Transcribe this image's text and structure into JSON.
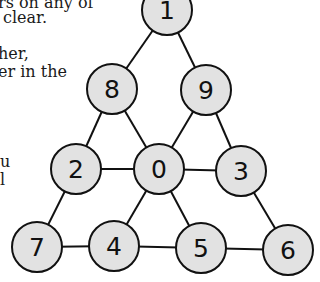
{
  "text_fragments": [
    {
      "text": "rs on any of",
      "x": -2,
      "y": -6
    },
    {
      "text": "clear.",
      "x": 3,
      "y": 9
    },
    {
      "text": "her,",
      "x": -2,
      "y": 45
    },
    {
      "text": "er in the",
      "x": -2,
      "y": 63
    },
    {
      "text": "u",
      "x": 0,
      "y": 153
    },
    {
      "text": "l",
      "x": 0,
      "y": 171
    }
  ],
  "diagram": {
    "node_fill": "#e2e2e2",
    "stroke": "#111111",
    "radius": 25,
    "nodes": [
      {
        "id": "1",
        "label": "1",
        "cx": 167,
        "cy": 10
      },
      {
        "id": "8",
        "label": "8",
        "cx": 112,
        "cy": 89
      },
      {
        "id": "9",
        "label": "9",
        "cx": 206,
        "cy": 90
      },
      {
        "id": "2",
        "label": "2",
        "cx": 76,
        "cy": 169
      },
      {
        "id": "0",
        "label": "0",
        "cx": 159,
        "cy": 169
      },
      {
        "id": "3",
        "label": "3",
        "cx": 241,
        "cy": 171
      },
      {
        "id": "7",
        "label": "7",
        "cx": 37,
        "cy": 247
      },
      {
        "id": "4",
        "label": "4",
        "cx": 114,
        "cy": 246
      },
      {
        "id": "5",
        "label": "5",
        "cx": 201,
        "cy": 248
      },
      {
        "id": "6",
        "label": "6",
        "cx": 288,
        "cy": 250
      }
    ],
    "edges": [
      [
        "1",
        "8"
      ],
      [
        "1",
        "9"
      ],
      [
        "8",
        "2"
      ],
      [
        "8",
        "0"
      ],
      [
        "9",
        "0"
      ],
      [
        "9",
        "3"
      ],
      [
        "2",
        "0"
      ],
      [
        "0",
        "3"
      ],
      [
        "2",
        "7"
      ],
      [
        "0",
        "4"
      ],
      [
        "0",
        "5"
      ],
      [
        "3",
        "6"
      ],
      [
        "7",
        "4"
      ],
      [
        "4",
        "5"
      ],
      [
        "5",
        "6"
      ]
    ]
  }
}
